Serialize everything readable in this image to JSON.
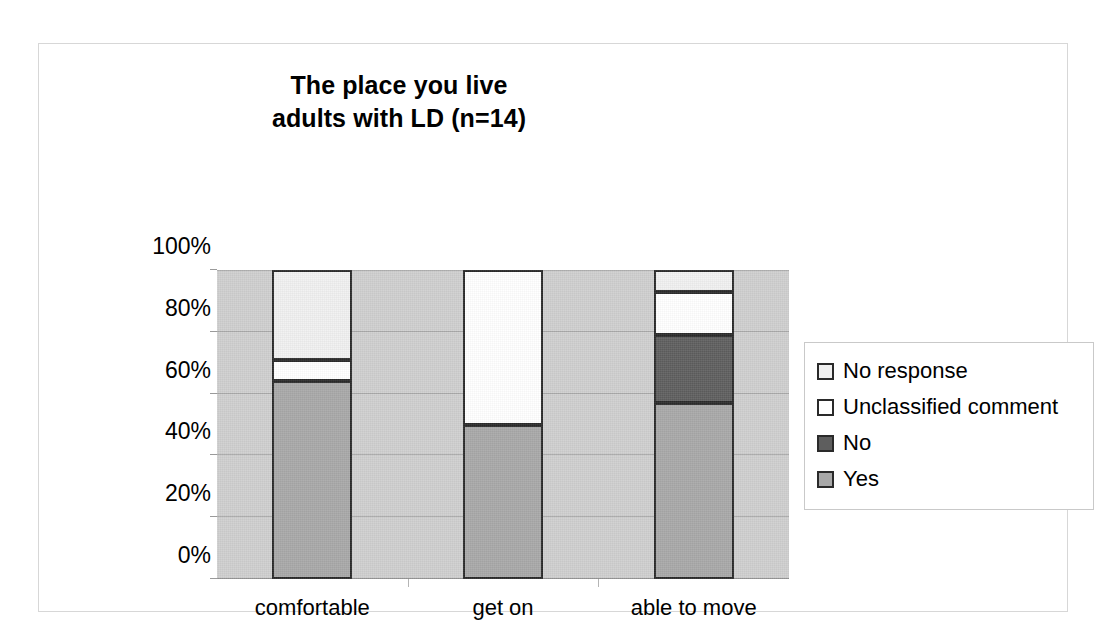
{
  "chart_data": {
    "type": "bar",
    "subtype": "stacked-100-percent",
    "title": "The place you live\nadults with LD (n=14)",
    "title_lines": [
      "The place you live",
      "adults with LD (n=14)"
    ],
    "xlabel": "",
    "ylabel": "",
    "categories": [
      "comfortable",
      "get on",
      "able to move"
    ],
    "ylim": [
      0,
      100
    ],
    "y_tick_labels": [
      "0%",
      "20%",
      "40%",
      "60%",
      "80%",
      "100%"
    ],
    "y_tick_values": [
      0,
      20,
      40,
      60,
      80,
      100
    ],
    "grid": true,
    "legend_position": "right",
    "stack_order_bottom_to_top": [
      "Yes",
      "No",
      "Unclassified comment",
      "No response"
    ],
    "series": [
      {
        "name": "Yes",
        "color": "#a8a8a8",
        "values": [
          64,
          50,
          57
        ]
      },
      {
        "name": "No",
        "color": "#5e5e5e",
        "values": [
          0,
          0,
          22
        ]
      },
      {
        "name": "Unclassified comment",
        "color": "#ffffff",
        "values": [
          7,
          50,
          14
        ]
      },
      {
        "name": "No response",
        "color": "#f0f0f0",
        "values": [
          29,
          0,
          7
        ]
      }
    ],
    "plot_background": "#cfcfcf",
    "bar_outline": "#2a2a2a"
  },
  "legend": {
    "items": [
      {
        "label": "No response",
        "color": "#f0f0f0"
      },
      {
        "label": "Unclassified comment",
        "color": "#ffffff"
      },
      {
        "label": "No",
        "color": "#5e5e5e"
      },
      {
        "label": "Yes",
        "color": "#a8a8a8"
      }
    ]
  }
}
